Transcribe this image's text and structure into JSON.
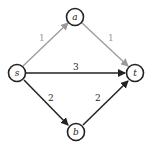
{
  "diagram": {
    "type": "flow-network",
    "nodes": [
      {
        "id": "s",
        "label": "s",
        "x": 17,
        "y": 73
      },
      {
        "id": "a",
        "label": "a",
        "x": 75,
        "y": 17
      },
      {
        "id": "t",
        "label": "t",
        "x": 135,
        "y": 73
      },
      {
        "id": "b",
        "label": "b",
        "x": 76,
        "y": 132
      }
    ],
    "edges": [
      {
        "from": "s",
        "to": "a",
        "label": "1",
        "color": "#9a9a9a"
      },
      {
        "from": "a",
        "to": "t",
        "label": "1",
        "color": "#9a9a9a"
      },
      {
        "from": "s",
        "to": "t",
        "label": "3",
        "color": "#222222"
      },
      {
        "from": "s",
        "to": "b",
        "label": "2",
        "color": "#222222"
      },
      {
        "from": "b",
        "to": "t",
        "label": "2",
        "color": "#222222"
      }
    ]
  }
}
